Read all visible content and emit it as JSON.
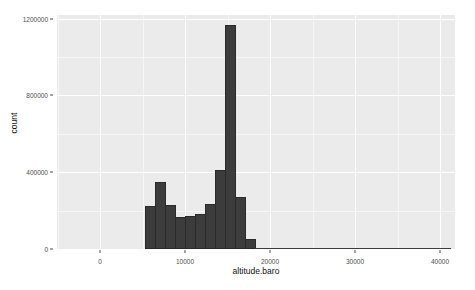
{
  "chart_data": {
    "type": "bar",
    "title": "",
    "subtitle": "",
    "xlabel": "altitude.baro",
    "ylabel": "count",
    "grid": true,
    "legend": "none",
    "xlim": [
      -2000,
      40000
    ],
    "ylim": [
      0,
      1300000
    ],
    "xticks": [
      0,
      10000,
      20000,
      30000,
      40000
    ],
    "xtick_labels": [
      "0",
      "10000",
      "20000",
      "30000",
      "40000"
    ],
    "yticks": [
      0,
      400000,
      800000,
      1200000
    ],
    "ytick_labels": [
      "0",
      "400000",
      "800000",
      "1200000"
    ],
    "bin_width": 1000,
    "bar_color": "#3c3c3c",
    "panel_color": "#ebebeb",
    "grid_color": "#ffffff",
    "bins": [
      {
        "x0": 0,
        "x1": 1000,
        "center": 500,
        "count": 240000
      },
      {
        "x0": 1000,
        "x1": 2000,
        "center": 1500,
        "count": 370000
      },
      {
        "x0": 2000,
        "x1": 3000,
        "center": 2500,
        "count": 245000
      },
      {
        "x0": 3000,
        "x1": 4000,
        "center": 3500,
        "count": 180000
      },
      {
        "x0": 4000,
        "x1": 5000,
        "center": 4500,
        "count": 185000
      },
      {
        "x0": 5000,
        "x1": 6000,
        "center": 5500,
        "count": 195000
      },
      {
        "x0": 6000,
        "x1": 7000,
        "center": 6500,
        "count": 250000
      },
      {
        "x0": 7000,
        "x1": 8000,
        "center": 7500,
        "count": 440000
      },
      {
        "x0": 8000,
        "x1": 9000,
        "center": 8500,
        "count": 1245000
      },
      {
        "x0": 9000,
        "x1": 10000,
        "center": 9500,
        "count": 290000
      },
      {
        "x0": 10000,
        "x1": 11000,
        "center": 10500,
        "count": 55000
      },
      {
        "x0": 11000,
        "x1": 40000,
        "center": 25500,
        "count": 2000
      }
    ],
    "bars_px": [
      {
        "left": 88,
        "width": 10.5,
        "height": 43
      },
      {
        "left": 98,
        "width": 10.5,
        "height": 67
      },
      {
        "left": 108,
        "width": 10.5,
        "height": 44
      },
      {
        "left": 118,
        "width": 10.5,
        "height": 32
      },
      {
        "left": 128,
        "width": 10.5,
        "height": 33
      },
      {
        "left": 138,
        "width": 10.5,
        "height": 35
      },
      {
        "left": 148,
        "width": 10.5,
        "height": 45
      },
      {
        "left": 158,
        "width": 10.5,
        "height": 79
      },
      {
        "left": 168,
        "width": 10.5,
        "height": 224
      },
      {
        "left": 178,
        "width": 10.5,
        "height": 52
      },
      {
        "left": 188,
        "width": 10.5,
        "height": 10
      }
    ],
    "tail_line": {
      "left": 198,
      "width": 196
    },
    "gridlines_major_y_px": [
      234,
      157,
      80,
      4
    ],
    "gridlines_minor_y_px": [
      196,
      119,
      42
    ],
    "gridlines_major_x_px": [
      43,
      128,
      213,
      298,
      383
    ],
    "gridlines_minor_x_px": [
      0.5,
      85.5,
      170.5,
      255.5,
      340.5
    ],
    "ytick_px": [
      234,
      157,
      80,
      4
    ],
    "xtick_px": [
      43,
      128,
      213,
      298,
      383
    ]
  }
}
